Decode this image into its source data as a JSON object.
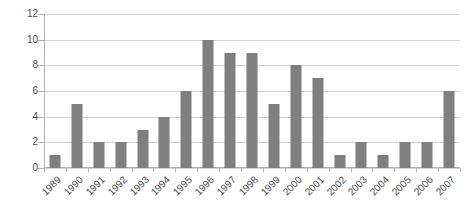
{
  "chart_data": {
    "type": "bar",
    "title": "",
    "subtitle": "",
    "xlabel": "",
    "ylabel": "",
    "categories": [
      "1989",
      "1990",
      "1991",
      "1992",
      "1993",
      "1994",
      "1995",
      "1996",
      "1997",
      "1998",
      "1999",
      "2000",
      "2001",
      "2002",
      "2003",
      "2004",
      "2005",
      "2006",
      "2007"
    ],
    "values": [
      1,
      5,
      2,
      2,
      3,
      4,
      6,
      10,
      9,
      9,
      5,
      8,
      7,
      1,
      2,
      1,
      2,
      2,
      6
    ],
    "ylim": [
      0,
      12
    ],
    "yticks": [
      0,
      2,
      4,
      6,
      8,
      10,
      12
    ],
    "ytick_labels": [
      "0",
      "2",
      "4",
      "6",
      "8",
      "10",
      "12"
    ],
    "grid": true,
    "grid_axis": "y",
    "legend": false,
    "legend_position": "none",
    "series": [
      {
        "name": "",
        "values": [
          1,
          5,
          2,
          2,
          3,
          4,
          6,
          10,
          9,
          9,
          5,
          8,
          7,
          1,
          2,
          1,
          2,
          2,
          6
        ]
      }
    ],
    "annotations": []
  },
  "colors": {
    "bar": "#7f7f7f",
    "gridline": "#d4d4d4",
    "axis": "#b3b3b3",
    "tick_label": "#4d4d4d",
    "background": "#ffffff"
  }
}
